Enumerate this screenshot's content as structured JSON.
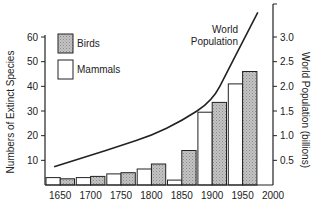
{
  "chart_data": {
    "type": "bar",
    "title": "",
    "xlabel": "",
    "ylabel": "Numbers of Extinct Species",
    "y2label": "World Population (billions)",
    "categories": [
      "1650",
      "1700",
      "1750",
      "1800",
      "1850",
      "1900",
      "1950"
    ],
    "x_ticks": [
      "1650",
      "1700",
      "1750",
      "1800",
      "1850",
      "1900",
      "1950",
      "2000"
    ],
    "y_ticks": [
      10,
      20,
      30,
      40,
      50,
      60
    ],
    "y2_ticks": [
      "0.5",
      "1.0",
      "1.5",
      "2.0",
      "2.5",
      "3.0"
    ],
    "ylim": [
      0,
      60
    ],
    "y2lim": [
      0,
      3.0
    ],
    "series": [
      {
        "name": "Mammals",
        "style": "white",
        "values": [
          3,
          3,
          4.5,
          6.5,
          2,
          29.5,
          41
        ]
      },
      {
        "name": "Birds",
        "style": "shaded",
        "values": [
          2.5,
          3.5,
          5,
          8.5,
          14,
          33.5,
          46
        ]
      }
    ],
    "line_series": {
      "name": "World Population",
      "axis": "right",
      "x": [
        1640,
        1700,
        1750,
        1800,
        1850,
        1900,
        1925,
        1950,
        1975
      ],
      "values": [
        0.37,
        0.6,
        0.8,
        1.0,
        1.3,
        1.7,
        2.3,
        2.9,
        3.5
      ]
    },
    "annotations": [
      {
        "text_lines": [
          "World",
          "Population"
        ],
        "target": "line_series"
      }
    ],
    "legend": {
      "position": "upper-left",
      "entries": [
        {
          "label": "Birds",
          "style": "shaded"
        },
        {
          "label": "Mammals",
          "style": "white"
        }
      ]
    },
    "grid": false,
    "colors": {
      "axis": "#222222",
      "shaded_fill": "#b4b4b4",
      "white_fill": "#ffffff",
      "line": "#222222"
    }
  }
}
